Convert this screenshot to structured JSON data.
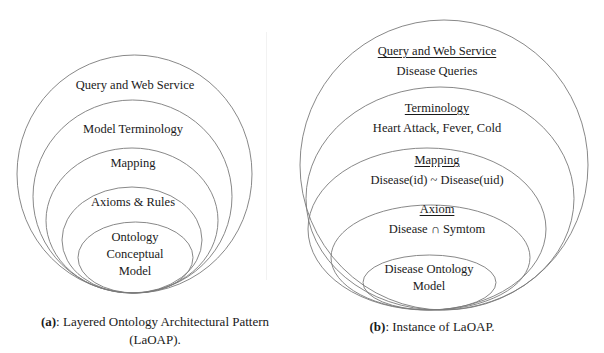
{
  "figure_a": {
    "caption_tag": "(a)",
    "caption_text": ": Layered Ontology Architectural Pattern",
    "caption_line2": "(LaOAP).",
    "layers": [
      {
        "label": "Query and Web Service"
      },
      {
        "label": "Model Terminology"
      },
      {
        "label": "Mapping"
      },
      {
        "label": "Axioms & Rules"
      },
      {
        "label_lines": [
          "Ontology",
          "Conceptual",
          "Model"
        ]
      }
    ]
  },
  "figure_b": {
    "caption_tag": "(b)",
    "caption_text": ": Instance of LaOAP.",
    "layers": [
      {
        "title": "Query and Web Service",
        "detail": "Disease Queries"
      },
      {
        "title": "Terminology",
        "detail": "Heart Attack, Fever, Cold"
      },
      {
        "title": "Mapping",
        "detail": "Disease(id) ~ Disease(uid)"
      },
      {
        "title": "Axiom",
        "detail": "Disease ∩ Symtom"
      },
      {
        "label_lines": [
          "Disease Ontology",
          "Model"
        ]
      }
    ]
  },
  "colors": {
    "stroke": "#7a7a7a",
    "text": "#1a1a1a",
    "background": "#ffffff"
  }
}
